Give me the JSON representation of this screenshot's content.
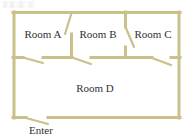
{
  "figure": {
    "kind": "floor-plan-diagram",
    "background_color": "#ffffff",
    "wall_color": "#c9c08a",
    "wall_highlight_color": "#ded6ae",
    "text_color": "#333030",
    "width": 191,
    "height": 139
  },
  "labels": {
    "room_a": "Room A",
    "room_b": "Room B",
    "room_c": "Room C",
    "room_d": "Room D",
    "enter": "Enter"
  },
  "label_positions": {
    "room_a": {
      "x": 43,
      "y": 38
    },
    "room_b": {
      "x": 98,
      "y": 38
    },
    "room_c": {
      "x": 153,
      "y": 38
    },
    "room_d": {
      "x": 95,
      "y": 92
    },
    "enter": {
      "x": 41,
      "y": 133
    }
  },
  "geometry": {
    "outline": {
      "left": 13,
      "top": 12,
      "right": 180,
      "bottom": 118,
      "stroke_width": 3
    },
    "interior_walls": [
      {
        "name": "wall-a-b",
        "x1": 71,
        "y1": 12,
        "x2": 71,
        "y2": 57
      },
      {
        "name": "wall-b-c",
        "x1": 125,
        "y1": 12,
        "x2": 125,
        "y2": 57
      },
      {
        "name": "wall-upper-lower",
        "x1": 13,
        "y1": 57,
        "x2": 180,
        "y2": 57
      }
    ],
    "doors": [
      {
        "name": "door-a-b",
        "between": [
          "Room A",
          "Room B"
        ],
        "hinge": {
          "x": 71,
          "y": 13
        },
        "leaf_end": {
          "x": 65,
          "y": 34
        }
      },
      {
        "name": "door-b-c",
        "between": [
          "Room B",
          "Room C"
        ],
        "hinge": {
          "x": 125,
          "y": 27
        },
        "leaf_end": {
          "x": 134,
          "y": 47
        }
      },
      {
        "name": "door-a-d",
        "between": [
          "Room A",
          "Room D"
        ],
        "hinge": {
          "x": 23,
          "y": 57
        },
        "leaf_end": {
          "x": 43,
          "y": 63
        }
      },
      {
        "name": "door-b-d",
        "between": [
          "Room B",
          "Room D"
        ],
        "hinge": {
          "x": 72,
          "y": 57
        },
        "leaf_end": {
          "x": 91,
          "y": 64
        }
      },
      {
        "name": "door-c-d",
        "between": [
          "Room C",
          "Room D"
        ],
        "hinge": {
          "x": 152,
          "y": 58
        },
        "leaf_end": {
          "x": 171,
          "y": 65
        }
      },
      {
        "name": "door-entrance",
        "between": [
          "Outside",
          "Room D"
        ],
        "hinge": {
          "x": 26,
          "y": 118
        },
        "leaf_end": {
          "x": 48,
          "y": 124
        }
      }
    ],
    "wall_gaps": [
      {
        "name": "gap-a-d",
        "x1": 23,
        "x2": 43,
        "y": 57
      },
      {
        "name": "gap-b-d",
        "x1": 72,
        "x2": 91,
        "y": 57
      },
      {
        "name": "gap-c-d",
        "x1": 152,
        "x2": 171,
        "y": 57
      },
      {
        "name": "gap-entrance",
        "x1": 26,
        "x2": 48,
        "y": 118
      },
      {
        "name": "gap-wall-b-c-door",
        "y1": 27,
        "y2": 47,
        "x": 125
      },
      {
        "name": "gap-wall-a-b-door",
        "y1": 13,
        "y2": 34,
        "x": 71
      }
    ]
  }
}
